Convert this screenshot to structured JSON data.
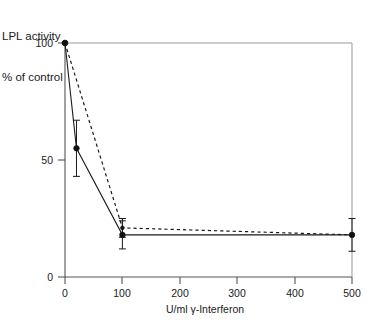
{
  "figure": {
    "y_axis_caption_line1": "LPL activity",
    "y_axis_caption_line2": "% of control",
    "x_axis_caption": "U/ml γ-Interferon"
  },
  "chart_data": {
    "type": "line",
    "title": "",
    "subtitle": "",
    "xlabel": "U/ml γ-Interferon",
    "ylabel": "LPL activity % of control",
    "xlim": [
      0,
      500
    ],
    "ylim": [
      0,
      100
    ],
    "xticks": [
      0,
      100,
      200,
      300,
      400,
      500
    ],
    "yticks": [
      0,
      50,
      100
    ],
    "xtick_labels": [
      "0",
      "100",
      "200",
      "300",
      "400",
      "500"
    ],
    "ytick_labels": [
      "0",
      "50",
      "100"
    ],
    "grid": false,
    "legend": null,
    "legend_position": "none",
    "marker": "filled-circle",
    "error_bars": "vertical",
    "series": [
      {
        "name": "solid-series",
        "line_style": "solid",
        "x": [
          0,
          20,
          100,
          500
        ],
        "values": [
          100,
          55,
          18,
          18
        ],
        "yerr": [
          0,
          12,
          6,
          7
        ]
      },
      {
        "name": "dashed-series",
        "line_style": "dashed",
        "x": [
          0,
          100,
          500
        ],
        "values": [
          100,
          21,
          18
        ],
        "yerr": [
          0,
          4,
          0
        ]
      }
    ]
  }
}
